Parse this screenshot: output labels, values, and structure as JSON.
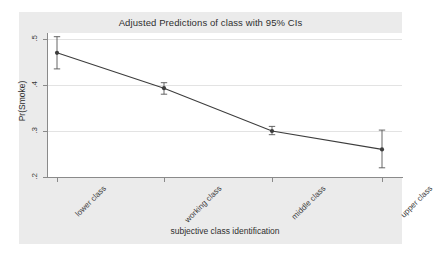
{
  "chart_data": {
    "type": "line",
    "title": "Adjusted Predictions of class with 95% CIs",
    "xlabel": "subjective class identification",
    "ylabel": "Pr(Smoke)",
    "categories": [
      "lower class",
      "working class",
      "middle class",
      "upper class"
    ],
    "values": [
      0.47,
      0.393,
      0.3,
      0.26
    ],
    "ci_lower": [
      0.435,
      0.38,
      0.292,
      0.22
    ],
    "ci_upper": [
      0.505,
      0.405,
      0.31,
      0.302
    ],
    "series": [
      {
        "name": "Pr(Smoke)",
        "values": [
          0.47,
          0.393,
          0.3,
          0.26
        ]
      }
    ],
    "ylim": [
      0.2,
      0.52
    ],
    "ytick_labels": [
      ".5",
      ".4",
      ".3",
      ".2"
    ],
    "ytick_values": [
      0.5,
      0.4,
      0.3,
      0.2
    ],
    "xtick_labels": [
      "lower class",
      "working class",
      "middle class",
      "upper class"
    ],
    "grid": true,
    "legend": "none",
    "marker": "filled-circle",
    "error_bars": "95% confidence interval"
  },
  "figure": {
    "title": "Adjusted Predictions of class with 95% CIs",
    "x_axis_title": "subjective class identification",
    "y_axis_title": "Pr(Smoke)",
    "background_color": "#ebebeb",
    "plot_background_color": "#ffffff",
    "line_color": "#404040",
    "marker_color": "#404040",
    "grid_color": "#e3e3e3",
    "axis_color": "#8a8a8a"
  },
  "y_ticks": [
    {
      "label": ".5",
      "value": 0.5
    },
    {
      "label": ".4",
      "value": 0.4
    },
    {
      "label": ".3",
      "value": 0.3
    },
    {
      "label": ".2",
      "value": 0.2
    }
  ],
  "x_ticks": [
    {
      "label": "lower class"
    },
    {
      "label": "working class"
    },
    {
      "label": "middle class"
    },
    {
      "label": "upper class"
    }
  ]
}
